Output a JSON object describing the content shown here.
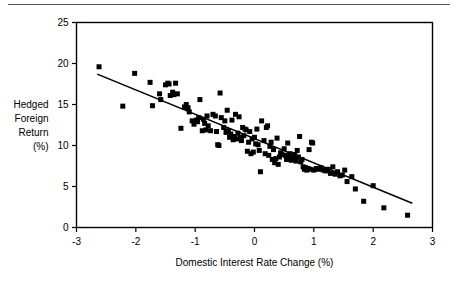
{
  "figure": {
    "name": "hedged-foreign-return-vs-domestic-interest-rate-change",
    "top_rule_color": "#5a5a5a",
    "marker_color": "#000000",
    "line_color": "#000000",
    "axis_color": "#000000",
    "background": "#ffffff"
  },
  "ylabel_lines": [
    "Hedged",
    "Foreign",
    "Return",
    "(%)"
  ],
  "chart_data": {
    "type": "scatter",
    "title": "",
    "subtitle": "",
    "xlabel": "Domestic Interest Rate Change (%)",
    "ylabel": "Hedged Foreign Return (%)",
    "xlim": [
      -3,
      3
    ],
    "ylim": [
      0,
      25
    ],
    "xticks": [
      -3,
      -2,
      -1,
      0,
      1,
      2,
      3
    ],
    "xticklabels": [
      "-3",
      "-2",
      "-1",
      "0",
      "1",
      "2",
      "3"
    ],
    "yticks": [
      0,
      5,
      10,
      15,
      20,
      25
    ],
    "yticklabels": [
      "0",
      "5",
      "10",
      "15",
      "20",
      "25"
    ],
    "grid": false,
    "legend": null,
    "marker": "square",
    "marker_size_px": 5,
    "series": [
      {
        "name": "Observations",
        "points": [
          [
            -2.62,
            19.6
          ],
          [
            -2.22,
            14.8
          ],
          [
            -2.02,
            18.8
          ],
          [
            -1.76,
            17.7
          ],
          [
            -1.72,
            14.85
          ],
          [
            -1.6,
            16.3
          ],
          [
            -1.58,
            15.6
          ],
          [
            -1.5,
            17.4
          ],
          [
            -1.46,
            17.6
          ],
          [
            -1.44,
            17.5
          ],
          [
            -1.42,
            16.1
          ],
          [
            -1.38,
            16.5
          ],
          [
            -1.36,
            16.2
          ],
          [
            -1.33,
            17.6
          ],
          [
            -1.3,
            16.3
          ],
          [
            -1.24,
            12.1
          ],
          [
            -1.18,
            14.7
          ],
          [
            -1.15,
            15.0
          ],
          [
            -1.12,
            14.6
          ],
          [
            -1.1,
            14.1
          ],
          [
            -1.05,
            13.0
          ],
          [
            -1.02,
            12.6
          ],
          [
            -0.98,
            13.1
          ],
          [
            -0.96,
            12.9
          ],
          [
            -0.94,
            13.4
          ],
          [
            -0.92,
            15.6
          ],
          [
            -0.88,
            11.8
          ],
          [
            -0.86,
            13.2
          ],
          [
            -0.84,
            12.7
          ],
          [
            -0.82,
            11.9
          ],
          [
            -0.8,
            13.6
          ],
          [
            -0.78,
            12.4
          ],
          [
            -0.74,
            11.8
          ],
          [
            -0.7,
            13.8
          ],
          [
            -0.66,
            13.6
          ],
          [
            -0.64,
            11.7
          ],
          [
            -0.62,
            10.1
          ],
          [
            -0.6,
            10.0
          ],
          [
            -0.58,
            16.4
          ],
          [
            -0.56,
            13.4
          ],
          [
            -0.52,
            12.2
          ],
          [
            -0.5,
            13.0
          ],
          [
            -0.48,
            11.6
          ],
          [
            -0.46,
            14.3
          ],
          [
            -0.44,
            11.8
          ],
          [
            -0.42,
            11.0
          ],
          [
            -0.4,
            11.4
          ],
          [
            -0.38,
            13.1
          ],
          [
            -0.36,
            10.7
          ],
          [
            -0.34,
            11.1
          ],
          [
            -0.32,
            13.8
          ],
          [
            -0.3,
            10.8
          ],
          [
            -0.28,
            11.5
          ],
          [
            -0.26,
            13.5
          ],
          [
            -0.24,
            11.0
          ],
          [
            -0.22,
            10.6
          ],
          [
            -0.2,
            12.2
          ],
          [
            -0.18,
            11.2
          ],
          [
            -0.16,
            12.0
          ],
          [
            -0.14,
            11.9
          ],
          [
            -0.12,
            9.3
          ],
          [
            -0.1,
            10.4
          ],
          [
            -0.08,
            11.7
          ],
          [
            -0.06,
            9.0
          ],
          [
            -0.04,
            10.8
          ],
          [
            -0.02,
            9.2
          ],
          [
            0.0,
            11.0
          ],
          [
            0.02,
            10.2
          ],
          [
            0.04,
            12.0
          ],
          [
            0.06,
            10.1
          ],
          [
            0.08,
            9.4
          ],
          [
            0.1,
            6.8
          ],
          [
            0.12,
            13.0
          ],
          [
            0.16,
            10.6
          ],
          [
            0.18,
            9.0
          ],
          [
            0.2,
            12.2
          ],
          [
            0.22,
            12.4
          ],
          [
            0.24,
            8.8
          ],
          [
            0.26,
            9.9
          ],
          [
            0.28,
            10.4
          ],
          [
            0.3,
            8.3
          ],
          [
            0.32,
            9.5
          ],
          [
            0.34,
            7.9
          ],
          [
            0.36,
            8.4
          ],
          [
            0.38,
            10.9
          ],
          [
            0.4,
            7.7
          ],
          [
            0.42,
            8.6
          ],
          [
            0.44,
            9.1
          ],
          [
            0.46,
            8.9
          ],
          [
            0.5,
            9.6
          ],
          [
            0.52,
            8.8
          ],
          [
            0.54,
            8.3
          ],
          [
            0.56,
            10.3
          ],
          [
            0.58,
            8.6
          ],
          [
            0.6,
            9.0
          ],
          [
            0.62,
            8.2
          ],
          [
            0.64,
            8.7
          ],
          [
            0.66,
            8.4
          ],
          [
            0.68,
            8.9
          ],
          [
            0.7,
            8.1
          ],
          [
            0.72,
            9.4
          ],
          [
            0.74,
            8.6
          ],
          [
            0.76,
            11.1
          ],
          [
            0.78,
            8.0
          ],
          [
            0.8,
            8.3
          ],
          [
            0.82,
            7.4
          ],
          [
            0.84,
            7.1
          ],
          [
            0.86,
            7.3
          ],
          [
            0.88,
            7.0
          ],
          [
            0.9,
            7.2
          ],
          [
            0.92,
            9.5
          ],
          [
            0.94,
            7.1
          ],
          [
            0.96,
            10.4
          ],
          [
            0.98,
            10.3
          ],
          [
            1.0,
            7.0
          ],
          [
            1.04,
            7.2
          ],
          [
            1.08,
            7.1
          ],
          [
            1.12,
            7.3
          ],
          [
            1.16,
            7.0
          ],
          [
            1.2,
            6.9
          ],
          [
            1.24,
            7.1
          ],
          [
            1.28,
            6.6
          ],
          [
            1.32,
            7.4
          ],
          [
            1.36,
            6.5
          ],
          [
            1.4,
            6.8
          ],
          [
            1.44,
            6.3
          ],
          [
            1.48,
            6.4
          ],
          [
            1.52,
            7.0
          ],
          [
            1.56,
            5.6
          ],
          [
            1.64,
            6.2
          ],
          [
            1.7,
            4.7
          ],
          [
            1.84,
            3.2
          ],
          [
            2.0,
            5.1
          ],
          [
            2.18,
            2.4
          ],
          [
            2.58,
            1.5
          ]
        ]
      }
    ],
    "trendline": {
      "name": "fitted-regression-line",
      "x": [
        -2.65,
        2.66
      ],
      "y": [
        18.7,
        2.95
      ],
      "slope": -2.97,
      "intercept": 10.83
    }
  }
}
